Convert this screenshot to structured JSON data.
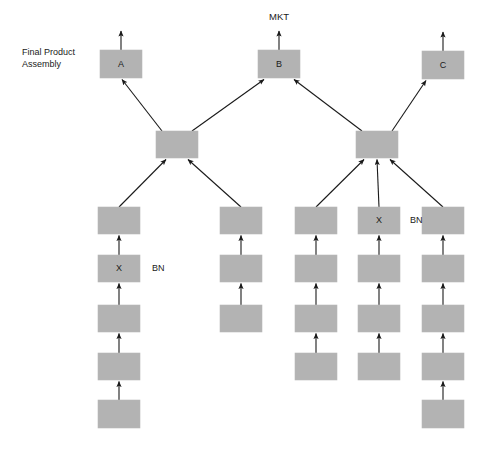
{
  "diagram": {
    "title_label": "Final Product\nAssembly",
    "title_line1": "Final Product",
    "title_line2": "Assembly",
    "market_label": "MKT",
    "box_fill": "#b3b3b3",
    "box_stroke": "#b8b8b8",
    "line_color": "#1a1a1a",
    "background": "#ffffff",
    "final_products": [
      {
        "id": "A",
        "label": "A",
        "x": 100,
        "y": 50,
        "w": 42,
        "h": 28
      },
      {
        "id": "B",
        "label": "B",
        "x": 258,
        "y": 50,
        "w": 42,
        "h": 28
      },
      {
        "id": "C",
        "label": "C",
        "x": 422,
        "y": 51,
        "w": 42,
        "h": 28
      }
    ],
    "subassemblies": [
      {
        "id": "SUB-L",
        "label": "",
        "x": 156,
        "y": 131,
        "w": 42,
        "h": 27
      },
      {
        "id": "SUB-R",
        "label": "",
        "x": 356,
        "y": 131,
        "w": 42,
        "h": 27
      }
    ],
    "components": [
      {
        "id": "c1r1",
        "label": "",
        "x": 98,
        "y": 207,
        "w": 42,
        "h": 27
      },
      {
        "id": "c1r2",
        "label": "X",
        "side_label": "BN",
        "x": 98,
        "y": 255,
        "w": 42,
        "h": 27
      },
      {
        "id": "c1r3",
        "label": "",
        "x": 98,
        "y": 305,
        "w": 42,
        "h": 27
      },
      {
        "id": "c1r4",
        "label": "",
        "x": 98,
        "y": 353,
        "w": 42,
        "h": 27
      },
      {
        "id": "c1r5",
        "label": "",
        "x": 98,
        "y": 400,
        "w": 42,
        "h": 28
      },
      {
        "id": "c2r1",
        "label": "",
        "x": 220,
        "y": 207,
        "w": 42,
        "h": 27
      },
      {
        "id": "c2r2",
        "label": "",
        "x": 220,
        "y": 255,
        "w": 42,
        "h": 27
      },
      {
        "id": "c2r3",
        "label": "",
        "x": 220,
        "y": 305,
        "w": 42,
        "h": 27
      },
      {
        "id": "c3r1",
        "label": "",
        "x": 295,
        "y": 207,
        "w": 42,
        "h": 27
      },
      {
        "id": "c3r2",
        "label": "",
        "x": 295,
        "y": 255,
        "w": 42,
        "h": 27
      },
      {
        "id": "c3r3",
        "label": "",
        "x": 295,
        "y": 305,
        "w": 42,
        "h": 27
      },
      {
        "id": "c3r4",
        "label": "",
        "x": 295,
        "y": 353,
        "w": 42,
        "h": 27
      },
      {
        "id": "c4r1",
        "label": "X",
        "side_label": "BN",
        "x": 358,
        "y": 207,
        "w": 42,
        "h": 27
      },
      {
        "id": "c4r2",
        "label": "",
        "x": 358,
        "y": 255,
        "w": 42,
        "h": 27
      },
      {
        "id": "c4r3",
        "label": "",
        "x": 358,
        "y": 305,
        "w": 42,
        "h": 27
      },
      {
        "id": "c4r4",
        "label": "",
        "x": 358,
        "y": 353,
        "w": 42,
        "h": 27
      },
      {
        "id": "c5r1",
        "label": "",
        "x": 422,
        "y": 207,
        "w": 42,
        "h": 27
      },
      {
        "id": "c5r2",
        "label": "",
        "x": 422,
        "y": 255,
        "w": 42,
        "h": 27
      },
      {
        "id": "c5r3",
        "label": "",
        "x": 422,
        "y": 305,
        "w": 42,
        "h": 27
      },
      {
        "id": "c5r4",
        "label": "",
        "x": 422,
        "y": 353,
        "w": 42,
        "h": 27
      },
      {
        "id": "c5r5",
        "label": "",
        "x": 422,
        "y": 400,
        "w": 42,
        "h": 28
      }
    ],
    "side_labels": [
      {
        "id": "bn-left",
        "text": "BN",
        "x": 152,
        "y": 269
      },
      {
        "id": "bn-right",
        "text": "BN",
        "x": 410,
        "y": 221
      }
    ],
    "output_arrows": [
      {
        "id": "out-A",
        "x": 121,
        "y_from": 50,
        "y_to": 31
      },
      {
        "id": "out-B",
        "x": 279,
        "y_from": 50,
        "y_to": 31
      },
      {
        "id": "out-C",
        "x": 443,
        "y_from": 51,
        "y_to": 32
      }
    ],
    "mkt_position": {
      "x": 279,
      "y": 17
    },
    "title_position": {
      "x": 22,
      "y": 57
    }
  }
}
